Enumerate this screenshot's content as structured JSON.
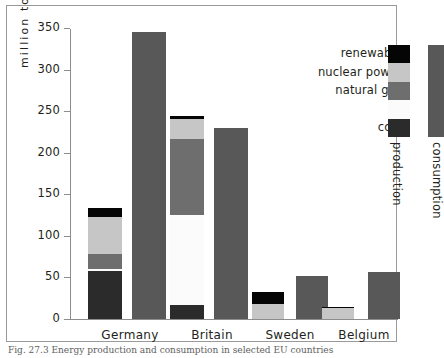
{
  "chart_data": {
    "type": "bar",
    "title": "",
    "subtitle": "",
    "xlabel": "",
    "ylabel": "million tonnes oil equivalent",
    "ylim": [
      0,
      350
    ],
    "yticks": [
      0,
      50,
      100,
      150,
      200,
      250,
      300,
      350
    ],
    "grid": false,
    "legend_position": "top-right",
    "categories": [
      "Germany",
      "Britain",
      "Sweden",
      "Belgium"
    ],
    "bar_kinds": [
      "production",
      "consumption"
    ],
    "stack_order": [
      "coal",
      "oil",
      "natural gas",
      "nuclear power",
      "renewable"
    ],
    "series": [
      {
        "name": "coal",
        "kind": "production",
        "values": [
          58,
          17,
          0,
          0
        ]
      },
      {
        "name": "oil",
        "kind": "production",
        "values": [
          2,
          108,
          0,
          0
        ]
      },
      {
        "name": "natural gas",
        "kind": "production",
        "values": [
          18,
          92,
          0,
          0
        ]
      },
      {
        "name": "nuclear power",
        "kind": "production",
        "values": [
          45,
          24,
          18,
          13
        ]
      },
      {
        "name": "renewable",
        "kind": "production",
        "values": [
          10,
          3,
          14,
          1
        ]
      },
      {
        "name": "consumption",
        "kind": "consumption",
        "values": [
          345,
          230,
          52,
          57
        ]
      }
    ],
    "production_totals": [
      133,
      244,
      32,
      14
    ],
    "consumption_totals": [
      345,
      230,
      52,
      57
    ],
    "colors": {
      "renewable": "#050505",
      "nuclear power": "#c6c6c6",
      "natural gas": "#6e6e6e",
      "oil": "#fbfbfb",
      "coal": "#2b2b2b",
      "consumption": "#585858",
      "axis": "#8d8d8d",
      "text": "#231f20",
      "background": "#ffffff",
      "frame": "#9a9a9a"
    }
  },
  "legend": {
    "entries": [
      {
        "label": "renewable",
        "color": "#050505"
      },
      {
        "label": "nuclear power",
        "color": "#c6c6c6"
      },
      {
        "label": "natural gas",
        "color": "#6e6e6e"
      },
      {
        "label": "oil",
        "color": "#fbfbfb"
      },
      {
        "label": "coal",
        "color": "#2b2b2b"
      }
    ],
    "production_label": "production",
    "consumption_label": "consumption"
  },
  "axis": {
    "y_title": "million tonnes oil equivalent",
    "tick_labels": [
      "350",
      "300",
      "250",
      "200",
      "150",
      "100",
      "50",
      "0"
    ]
  },
  "caption": "Fig. 27.3 Energy production and consumption in selected EU countries"
}
